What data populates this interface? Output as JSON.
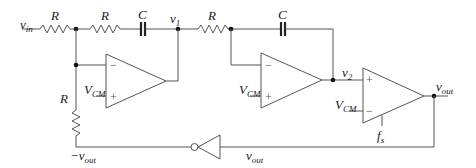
{
  "diagram": {
    "type": "circuit-schematic",
    "colors": {
      "wire": "#555555",
      "node": "#111111",
      "text": "#222222",
      "background": "#ffffff"
    },
    "labels": {
      "vin": {
        "main": "v",
        "sub": "in"
      },
      "r1": "R",
      "r2": "R",
      "r3": "R",
      "r4": "R",
      "c1": "C",
      "c2": "C",
      "v1": {
        "main": "v",
        "sub": "1"
      },
      "v2": {
        "main": "v",
        "sub": "2"
      },
      "vcm1": {
        "main": "V",
        "sub": "CM"
      },
      "vcm2": {
        "main": "V",
        "sub": "CM"
      },
      "vcm3": {
        "main": "V",
        "sub": "CM"
      },
      "vout": {
        "main": "v",
        "sub": "out"
      },
      "vout_bottom": {
        "main": "v",
        "sub": "out"
      },
      "neg_vout": {
        "main": "−v",
        "sub": "out"
      },
      "fs": {
        "main": "f",
        "sub": "s"
      }
    },
    "opamps": [
      {
        "id": "opamp1",
        "minus": "−",
        "plus": "+"
      },
      {
        "id": "opamp2",
        "minus": "−",
        "plus": "+"
      },
      {
        "id": "comparator",
        "plus": "+",
        "minus": "−"
      }
    ],
    "inverter": {
      "id": "inverter"
    }
  }
}
